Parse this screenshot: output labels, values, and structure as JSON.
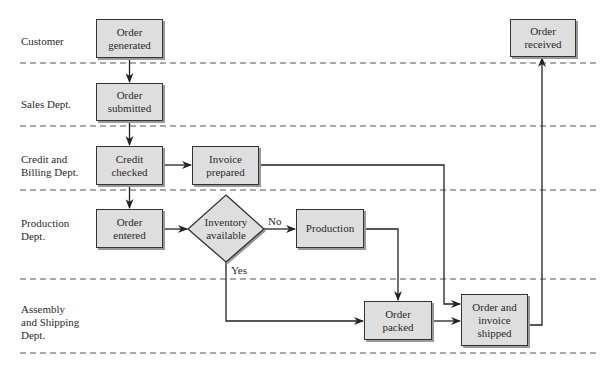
{
  "lanes": [
    {
      "name": "Customer",
      "label_lines": [
        "Customer"
      ]
    },
    {
      "name": "Sales Dept.",
      "label_lines": [
        "Sales Dept."
      ]
    },
    {
      "name": "Credit and Billing Dept.",
      "label_lines": [
        "Credit and",
        "Billing Dept."
      ]
    },
    {
      "name": "Production Dept.",
      "label_lines": [
        "Production",
        "Dept."
      ]
    },
    {
      "name": "Assembly and Shipping Dept.",
      "label_lines": [
        "Assembly",
        "and Shipping",
        "Dept."
      ]
    }
  ],
  "nodes": {
    "order_generated": {
      "line1": "Order",
      "line2": "generated"
    },
    "order_submitted": {
      "line1": "Order",
      "line2": "submitted"
    },
    "credit_checked": {
      "line1": "Credit",
      "line2": "checked"
    },
    "invoice_prepared": {
      "line1": "Invoice",
      "line2": "prepared"
    },
    "order_entered": {
      "line1": "Order",
      "line2": "entered"
    },
    "inventory_available": {
      "line1": "Inventory",
      "line2": "available"
    },
    "production": {
      "line1": "Production"
    },
    "order_packed": {
      "line1": "Order",
      "line2": "packed"
    },
    "order_invoice_shipped": {
      "line1": "Order and",
      "line2": "invoice",
      "line3": "shipped"
    },
    "order_received": {
      "line1": "Order",
      "line2": "received"
    }
  },
  "edge_labels": {
    "no": "No",
    "yes": "Yes"
  },
  "colors": {
    "box_fill": "#dedede",
    "stroke": "#333333",
    "shadow": "#9a9a9a",
    "dash": "#555555"
  }
}
